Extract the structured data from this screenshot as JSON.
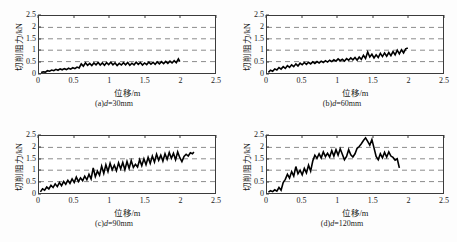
{
  "figure": {
    "background": "#fdfdfd",
    "axis_color": "#3b3b3b",
    "grid_color": "#8c8c8c",
    "series_color": "#000000",
    "footer_note": ""
  },
  "axes": {
    "xlabel": "位移/m",
    "ylabel": "切削阻力/kN",
    "xticks": [
      "0",
      "0.5",
      "1",
      "1.5",
      "2",
      "2.5"
    ],
    "yticks": [
      "0",
      "0.5",
      "1",
      "1.5",
      "2",
      "2.5"
    ],
    "xlim": [
      0,
      2.5
    ],
    "ylim": [
      0,
      2.5
    ],
    "gridlines_y": [
      0.5,
      1,
      1.5,
      2
    ]
  },
  "panels": [
    {
      "key": "a",
      "caption_prefix": "(a)",
      "caption_var": "d",
      "caption_value": "=30mm"
    },
    {
      "key": "b",
      "caption_prefix": "(b)",
      "caption_var": "d",
      "caption_value": "=60mm"
    },
    {
      "key": "c",
      "caption_prefix": "(c)",
      "caption_var": "d",
      "caption_value": "=90mm"
    },
    {
      "key": "d",
      "caption_prefix": "(d)",
      "caption_var": "d",
      "caption_value": "=120mm"
    }
  ],
  "chart_data": [
    {
      "type": "line",
      "title": "(a)d=30mm",
      "xlabel": "位移/m",
      "ylabel": "切削阻力/kN",
      "xlim": [
        0,
        2.5
      ],
      "ylim": [
        0,
        2.5
      ],
      "grid": true,
      "legend": "none",
      "series": [
        {
          "name": "d=30mm",
          "x": [
            0.03,
            0.06,
            0.09,
            0.12,
            0.15,
            0.18,
            0.21,
            0.24,
            0.27,
            0.3,
            0.33,
            0.36,
            0.39,
            0.42,
            0.45,
            0.48,
            0.51,
            0.54,
            0.57,
            0.6,
            0.63,
            0.66,
            0.69,
            0.72,
            0.75,
            0.78,
            0.81,
            0.84,
            0.87,
            0.9,
            0.93,
            0.96,
            0.99,
            1.02,
            1.05,
            1.08,
            1.11,
            1.14,
            1.17,
            1.2,
            1.23,
            1.26,
            1.29,
            1.32,
            1.35,
            1.38,
            1.41,
            1.44,
            1.47,
            1.5,
            1.53,
            1.56,
            1.59,
            1.62,
            1.65,
            1.68,
            1.71,
            1.74,
            1.77,
            1.8,
            1.83,
            1.86,
            1.89,
            1.92,
            1.95,
            1.98,
            2.0
          ],
          "y": [
            0.02,
            0.05,
            0.04,
            0.1,
            0.08,
            0.13,
            0.1,
            0.16,
            0.12,
            0.18,
            0.14,
            0.19,
            0.15,
            0.21,
            0.17,
            0.23,
            0.19,
            0.26,
            0.22,
            0.4,
            0.3,
            0.45,
            0.34,
            0.42,
            0.33,
            0.44,
            0.36,
            0.46,
            0.35,
            0.44,
            0.34,
            0.45,
            0.37,
            0.47,
            0.36,
            0.44,
            0.33,
            0.42,
            0.35,
            0.45,
            0.36,
            0.46,
            0.34,
            0.43,
            0.36,
            0.47,
            0.38,
            0.46,
            0.35,
            0.44,
            0.37,
            0.48,
            0.39,
            0.47,
            0.38,
            0.49,
            0.4,
            0.5,
            0.41,
            0.51,
            0.42,
            0.52,
            0.44,
            0.54,
            0.45,
            0.62,
            0.5
          ]
        }
      ]
    },
    {
      "type": "line",
      "title": "(b)d=60mm",
      "xlabel": "位移/m",
      "ylabel": "切削阻力/kN",
      "xlim": [
        0,
        2.5
      ],
      "ylim": [
        0,
        2.5
      ],
      "grid": true,
      "legend": "none",
      "series": [
        {
          "name": "d=60mm",
          "x": [
            0.02,
            0.05,
            0.08,
            0.11,
            0.14,
            0.17,
            0.2,
            0.23,
            0.26,
            0.29,
            0.32,
            0.35,
            0.38,
            0.41,
            0.44,
            0.47,
            0.5,
            0.53,
            0.56,
            0.59,
            0.62,
            0.65,
            0.68,
            0.71,
            0.74,
            0.77,
            0.8,
            0.83,
            0.86,
            0.89,
            0.92,
            0.95,
            0.98,
            1.01,
            1.04,
            1.07,
            1.1,
            1.13,
            1.16,
            1.19,
            1.22,
            1.25,
            1.28,
            1.31,
            1.34,
            1.37,
            1.4,
            1.43,
            1.46,
            1.49,
            1.52,
            1.55,
            1.58,
            1.61,
            1.64,
            1.67,
            1.7,
            1.73,
            1.76,
            1.79,
            1.82,
            1.85,
            1.88,
            1.91,
            1.94,
            1.97,
            2.0
          ],
          "y": [
            0.03,
            0.12,
            0.08,
            0.18,
            0.13,
            0.24,
            0.17,
            0.28,
            0.2,
            0.32,
            0.25,
            0.36,
            0.28,
            0.4,
            0.31,
            0.43,
            0.36,
            0.46,
            0.38,
            0.47,
            0.4,
            0.49,
            0.42,
            0.5,
            0.44,
            0.52,
            0.46,
            0.54,
            0.48,
            0.56,
            0.5,
            0.58,
            0.52,
            0.62,
            0.54,
            0.6,
            0.52,
            0.63,
            0.56,
            0.66,
            0.58,
            0.68,
            0.56,
            0.7,
            0.6,
            0.78,
            0.64,
            0.92,
            0.7,
            0.82,
            0.66,
            0.8,
            0.68,
            0.86,
            0.72,
            0.88,
            0.74,
            0.9,
            0.76,
            0.94,
            0.8,
            1.0,
            0.84,
            1.02,
            0.88,
            1.06,
            1.1
          ]
        }
      ]
    },
    {
      "type": "line",
      "title": "(c)d=90mm",
      "xlabel": "位移/m",
      "ylabel": "切削阻力/kN",
      "xlim": [
        0,
        2.5
      ],
      "ylim": [
        0,
        2.5
      ],
      "grid": true,
      "legend": "none",
      "series": [
        {
          "name": "d=90mm",
          "x": [
            0.02,
            0.05,
            0.08,
            0.11,
            0.14,
            0.17,
            0.2,
            0.23,
            0.26,
            0.29,
            0.32,
            0.35,
            0.38,
            0.41,
            0.44,
            0.47,
            0.5,
            0.53,
            0.56,
            0.59,
            0.62,
            0.65,
            0.68,
            0.71,
            0.74,
            0.77,
            0.8,
            0.83,
            0.86,
            0.89,
            0.92,
            0.95,
            0.98,
            1.01,
            1.04,
            1.07,
            1.1,
            1.13,
            1.16,
            1.19,
            1.22,
            1.25,
            1.28,
            1.31,
            1.34,
            1.37,
            1.4,
            1.43,
            1.46,
            1.49,
            1.52,
            1.55,
            1.58,
            1.61,
            1.64,
            1.67,
            1.7,
            1.73,
            1.76,
            1.79,
            1.82,
            1.85,
            1.88,
            1.91,
            1.94,
            1.97,
            2.0,
            2.03,
            2.06,
            2.09,
            2.12,
            2.15,
            2.18,
            2.2
          ],
          "y": [
            0.05,
            0.18,
            0.12,
            0.26,
            0.18,
            0.34,
            0.24,
            0.4,
            0.28,
            0.46,
            0.32,
            0.5,
            0.38,
            0.56,
            0.42,
            0.62,
            0.46,
            0.7,
            0.5,
            0.66,
            0.54,
            0.74,
            0.58,
            0.82,
            0.62,
            1.1,
            0.72,
            0.96,
            0.78,
            1.18,
            0.86,
            1.24,
            0.94,
            1.3,
            1.02,
            1.22,
            0.98,
            1.32,
            1.06,
            1.34,
            1.02,
            1.38,
            1.08,
            1.42,
            1.12,
            1.26,
            1.14,
            1.46,
            1.2,
            1.5,
            1.24,
            1.56,
            1.3,
            1.62,
            1.36,
            1.7,
            1.44,
            1.66,
            1.4,
            1.72,
            1.48,
            1.78,
            1.52,
            1.74,
            1.46,
            1.8,
            1.55,
            1.38,
            1.6,
            1.7,
            1.62,
            1.76,
            1.72,
            1.8
          ]
        }
      ]
    },
    {
      "type": "line",
      "title": "(d)d=120mm",
      "xlabel": "位移/m",
      "ylabel": "切削阻力/kN",
      "xlim": [
        0,
        2.5
      ],
      "ylim": [
        0,
        2.5
      ],
      "grid": true,
      "legend": "none",
      "series": [
        {
          "name": "d=120mm",
          "x": [
            0.02,
            0.05,
            0.08,
            0.11,
            0.14,
            0.17,
            0.2,
            0.23,
            0.26,
            0.29,
            0.32,
            0.35,
            0.38,
            0.41,
            0.44,
            0.47,
            0.5,
            0.53,
            0.56,
            0.59,
            0.62,
            0.65,
            0.68,
            0.71,
            0.74,
            0.77,
            0.8,
            0.83,
            0.86,
            0.89,
            0.92,
            0.95,
            0.98,
            1.01,
            1.04,
            1.07,
            1.1,
            1.13,
            1.16,
            1.19,
            1.22,
            1.25,
            1.28,
            1.31,
            1.34,
            1.37,
            1.4,
            1.43,
            1.46,
            1.49,
            1.52,
            1.55,
            1.58,
            1.61,
            1.64,
            1.67,
            1.7,
            1.73,
            1.76,
            1.79,
            1.82,
            1.85,
            1.88
          ],
          "y": [
            0.04,
            0.1,
            0.06,
            0.14,
            0.08,
            0.24,
            0.12,
            0.46,
            0.6,
            0.82,
            0.66,
            0.94,
            0.74,
            1.16,
            0.84,
            1.0,
            0.8,
            1.08,
            0.88,
            1.22,
            0.96,
            1.4,
            1.66,
            1.52,
            1.72,
            1.54,
            1.8,
            1.6,
            1.74,
            1.58,
            1.86,
            1.62,
            1.9,
            1.66,
            1.94,
            1.7,
            1.46,
            1.6,
            1.9,
            1.68,
            1.58,
            1.72,
            1.96,
            2.04,
            2.16,
            2.3,
            2.42,
            2.26,
            2.1,
            2.34,
            1.98,
            1.6,
            1.46,
            1.72,
            1.54,
            1.78,
            1.58,
            1.8,
            1.62,
            1.56,
            1.44,
            1.5,
            1.1
          ]
        }
      ]
    }
  ]
}
